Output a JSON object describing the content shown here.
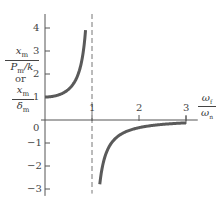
{
  "chart_data": {
    "type": "line",
    "title": "",
    "xlabel": "ω_f / ω_n",
    "ylabel": "x_m / (P_m/k)  or  x_m / δ_m",
    "xlabel_parts": {
      "num": "ω",
      "num_sub": "f",
      "den": "ω",
      "den_sub": "n"
    },
    "ylabel_parts": {
      "top": {
        "num": "x",
        "num_sub": "m",
        "den": "P",
        "den_sub": "m",
        "den_tail": "/k"
      },
      "or": "or",
      "bottom": {
        "num": "x",
        "num_sub": "m",
        "den": "δ",
        "den_sub": "m"
      }
    },
    "xlim": [
      0,
      3.2
    ],
    "ylim": [
      -3.3,
      4.6
    ],
    "x_ticks": [
      1,
      2,
      3
    ],
    "x_tick_labels": [
      "1",
      "2",
      "3"
    ],
    "y_ticks": [
      -3,
      -2,
      -1,
      0,
      1,
      2,
      3,
      4
    ],
    "y_tick_labels": [
      "−3",
      "−2",
      "−1",
      "0",
      "1",
      "2",
      "3",
      "4"
    ],
    "grid": false,
    "legend": null,
    "asymptote": {
      "x": 1,
      "style": "dashed"
    },
    "series": [
      {
        "name": "below resonance",
        "formula": "1/(1-r^2)",
        "x": [
          0,
          0.2,
          0.4,
          0.5,
          0.6,
          0.7,
          0.8,
          0.85,
          0.9,
          0.93
        ],
        "y": [
          1.0,
          1.04,
          1.19,
          1.33,
          1.56,
          1.96,
          2.78,
          3.6,
          5.26,
          7.4
        ],
        "plotted_y_max": 4.0
      },
      {
        "name": "above resonance",
        "formula": "1/(1-r^2)",
        "x": [
          1.14,
          1.2,
          1.3,
          1.5,
          1.75,
          2.0,
          2.25,
          2.5,
          2.75,
          3.0
        ],
        "y": [
          -3.3,
          -2.27,
          -1.45,
          -0.8,
          -0.48,
          -0.33,
          -0.25,
          -0.19,
          -0.15,
          -0.125
        ]
      }
    ],
    "annotations": []
  },
  "colors": {
    "curve": "#5a5a5a",
    "axis": "#555555",
    "dash": "#666666"
  }
}
